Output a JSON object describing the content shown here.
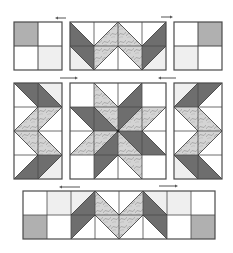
{
  "diagram": {
    "colors": {
      "background": "#ffffff",
      "grid_line": "#4a4a4a",
      "dark_fabric": "#6e6e6e",
      "medium_fabric": "#b0b0b0",
      "light_fabric": "#efefef",
      "print_fabric": "#d4d4d4",
      "print_swirl": "#9a9a9a",
      "arrow": "#555555"
    },
    "rows": [
      {
        "name": "top-row",
        "blocks": [
          "four-patch-left",
          "chevron-border-top",
          "four-patch-right"
        ],
        "arrows": [
          {
            "direction": "left",
            "x1": 66,
            "x2": 55,
            "y": 18
          },
          {
            "direction": "right",
            "x1": 161,
            "x2": 173,
            "y": 17
          }
        ]
      },
      {
        "name": "middle-row",
        "blocks": [
          "chevron-border-left",
          "star-center",
          "chevron-border-right"
        ],
        "arrows": [
          {
            "direction": "right",
            "x1": 60,
            "x2": 78,
            "y": 78
          },
          {
            "direction": "left",
            "x1": 176,
            "x2": 158,
            "y": 78
          }
        ]
      },
      {
        "name": "bottom-row",
        "blocks": [
          "chevron-border-bottom"
        ],
        "arrows": [
          {
            "direction": "left",
            "x1": 80,
            "x2": 59,
            "y": 187
          },
          {
            "direction": "right",
            "x1": 159,
            "x2": 178,
            "y": 186
          }
        ]
      }
    ]
  }
}
